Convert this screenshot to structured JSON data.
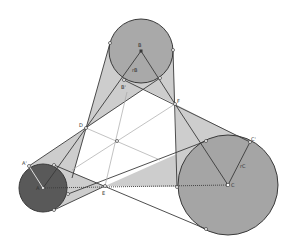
{
  "diagram": {
    "type": "geometry-construction",
    "colors": {
      "background": "#ffffff",
      "region_fill": "#c8c8c8",
      "circle_b_fill": "#a9a9a9",
      "circle_c_fill": "#a5a5a5",
      "circle_a_fill": "#595959",
      "stroke": "#3a3a3a",
      "guide_line": "#a0a0a0"
    },
    "circles": [
      {
        "name": "B",
        "cx": 141,
        "cy": 51,
        "r": 32
      },
      {
        "name": "A",
        "cx": 43,
        "cy": 188,
        "r": 24
      },
      {
        "name": "C",
        "cx": 228,
        "cy": 185,
        "r": 50
      }
    ],
    "points": {
      "D": {
        "label": "D",
        "x": 86,
        "y": 128
      },
      "F": {
        "label": "F",
        "x": 175,
        "y": 104
      },
      "E": {
        "label": "E",
        "x": 105,
        "y": 186
      },
      "O": {
        "label": "",
        "x": 117,
        "y": 141
      },
      "A_prime": {
        "label": "A'",
        "x": 29,
        "y": 166
      },
      "B_prime": {
        "label": "B'",
        "x": 124,
        "y": 80
      },
      "C_prime": {
        "label": "C'",
        "x": 250,
        "y": 142
      },
      "A": {
        "label": "A",
        "x": 43,
        "y": 188
      },
      "B": {
        "label": "B",
        "x": 141,
        "y": 51
      },
      "C": {
        "label": "C",
        "x": 228,
        "y": 185
      }
    },
    "labels": {
      "rB": "rB",
      "rC": "rC",
      "rA": "rA"
    }
  }
}
